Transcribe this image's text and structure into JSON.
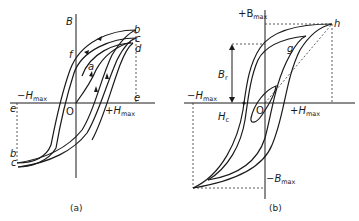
{
  "figure_a": {
    "caption": "(a)",
    "axis_labels": {
      "y": "B",
      "origin": "O",
      "neg_h": "−H",
      "neg_h_sub": "max",
      "pos_h": "+H",
      "pos_h_sub": "max"
    },
    "point_labels": {
      "a": "a",
      "b_top": "b",
      "c_top": "c",
      "d": "d",
      "e_right": "e",
      "e_left": "e",
      "f": "f",
      "b_bottom": "b",
      "c_bottom": "c"
    }
  },
  "figure_b": {
    "caption": "(b)",
    "axis_labels": {
      "pos_b": "+B",
      "pos_b_sub": "max",
      "neg_b": "−B",
      "neg_b_sub": "max",
      "origin": "O",
      "neg_h": "−H",
      "neg_h_sub": "max",
      "pos_h": "+H",
      "pos_h_sub": "max"
    },
    "point_labels": {
      "h": "h",
      "g": "g",
      "remanence": "B",
      "remanence_sub": "r",
      "coercivity": "H",
      "coercivity_sub": "c"
    }
  }
}
